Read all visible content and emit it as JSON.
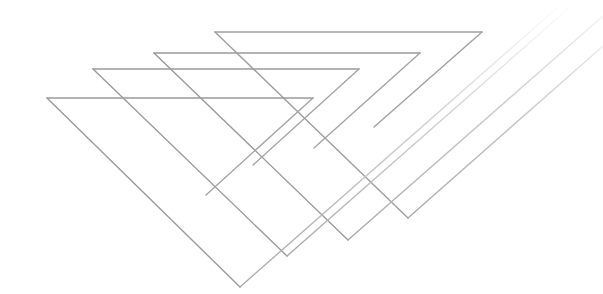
{
  "artwork": {
    "description": "Abstract line art: four nested open triangular chevron outlines in grey on white",
    "background": "#ffffff",
    "stroke_color": "#9a9a9a",
    "stroke_light": "#c4c4c4",
    "shapes": [
      {
        "name": "chevron-a",
        "top_left": [
          47,
          98
        ],
        "top_right": [
          313,
          98
        ],
        "inner_end": [
          206,
          195
        ],
        "bottom": [
          240,
          287
        ],
        "tail_end": [
          566,
          0
        ]
      },
      {
        "name": "chevron-b",
        "top_left": [
          93,
          69
        ],
        "top_right": [
          359,
          69
        ],
        "inner_end": [
          253,
          165
        ],
        "bottom": [
          287,
          256
        ],
        "tail_end": [
          578,
          0
        ]
      },
      {
        "name": "chevron-c",
        "top_left": [
          154,
          53
        ],
        "top_right": [
          420,
          53
        ],
        "inner_end": [
          314,
          148
        ],
        "bottom": [
          348,
          240
        ],
        "tail_end": [
          603,
          16
        ]
      },
      {
        "name": "chevron-d",
        "top_left": [
          215,
          32
        ],
        "top_right": [
          482,
          32
        ],
        "inner_end": [
          374,
          127
        ],
        "bottom": [
          408,
          218
        ],
        "tail_end": [
          603,
          46
        ]
      }
    ]
  }
}
